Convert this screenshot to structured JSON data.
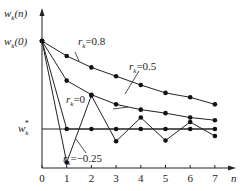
{
  "chart_data": {
    "type": "line",
    "title": "",
    "xlabel": "n",
    "ylabel": "w_k(n)",
    "y_start_label": "w_k(0)",
    "y_target_label": "w_k*",
    "x": [
      0,
      1,
      2,
      3,
      4,
      5,
      6,
      7
    ],
    "x_ticks": [
      "0",
      "1",
      "2",
      "3",
      "4",
      "5",
      "6",
      "7"
    ],
    "ylim_normalized": [
      -0.45,
      1.0
    ],
    "series": [
      {
        "name": "r_k=0.8",
        "label": "rₖ=0.8",
        "values": [
          1.0,
          0.83,
          0.7,
          0.6,
          0.5,
          0.41,
          0.36,
          0.28
        ]
      },
      {
        "name": "r_k=0.5",
        "label": "rₖ=0.5",
        "values": [
          1.0,
          0.55,
          0.39,
          0.28,
          0.22,
          0.18,
          0.13,
          0.1
        ]
      },
      {
        "name": "r_k=0",
        "label": "rₖ=0",
        "values": [
          1.0,
          0.0,
          0.0,
          0.0,
          0.0,
          0.0,
          0.0,
          0.0
        ]
      },
      {
        "name": "r_k=-0.25",
        "label": "rₖ=−0.25",
        "values": [
          1.0,
          -0.38,
          0.38,
          -0.14,
          0.13,
          -0.13,
          0.08,
          -0.08
        ]
      }
    ],
    "grid": false,
    "legend": "inline labels"
  },
  "labels": {
    "ylabel": "w",
    "ylabel_sub": "k",
    "ylabel_tail": "(n)",
    "y0": "w",
    "y0_sub": "k",
    "y0_tail": "(0)",
    "ystar": "w",
    "ystar_sub": "k",
    "ystar_sup": "*",
    "xlabel": "n",
    "r08": "=0.8",
    "r05": "=0.5",
    "r0": "=0",
    "rm025": "=−0.25",
    "r": "r",
    "rsub": "k"
  }
}
